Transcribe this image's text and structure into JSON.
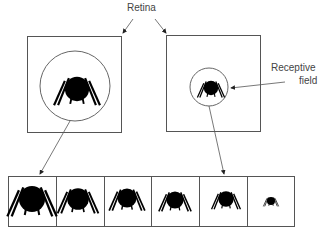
{
  "labels": {
    "retina": "Retina",
    "receptive_line1": "Receptive",
    "receptive_line2": "field"
  },
  "colors": {
    "stroke": "#555555",
    "figure": "#000000",
    "background": "#ffffff"
  },
  "panels": [
    {
      "id": "retina-large-rf",
      "receptive_field": "large"
    },
    {
      "id": "retina-small-rf",
      "receptive_field": "small"
    }
  ],
  "scale_sequence": {
    "cells": 6,
    "figure_sizes": [
      "largest",
      "large",
      "medium",
      "medium-small",
      "small",
      "smallest"
    ]
  }
}
